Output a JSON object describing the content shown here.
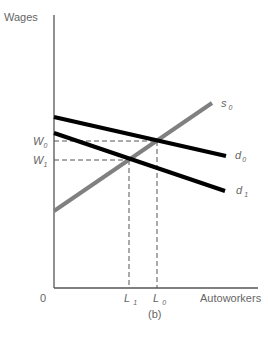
{
  "diagram": {
    "caption": "(b)",
    "y_axis_label": "Wages",
    "x_axis_label": "Autoworkers",
    "origin_label": "0",
    "curves": [
      {
        "id": "s0",
        "label": "s",
        "subscript": "0",
        "type": "supply",
        "color": "#808080"
      },
      {
        "id": "d0",
        "label": "d",
        "subscript": "0",
        "type": "demand",
        "color": "#000000"
      },
      {
        "id": "d1",
        "label": "d",
        "subscript": "1",
        "type": "demand",
        "color": "#000000"
      }
    ],
    "y_markers": [
      {
        "label": "W",
        "subscript": "0"
      },
      {
        "label": "W",
        "subscript": "1"
      }
    ],
    "x_markers": [
      {
        "label": "L",
        "subscript": "1"
      },
      {
        "label": "L",
        "subscript": "0"
      }
    ],
    "guide_style": "dashed"
  }
}
